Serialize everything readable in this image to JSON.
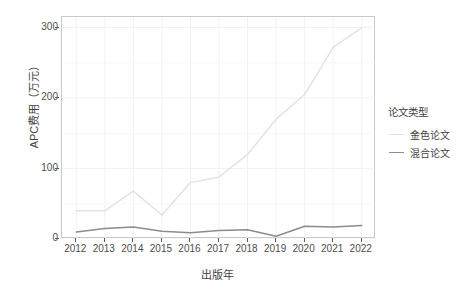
{
  "chart_data": {
    "type": "line",
    "title": "",
    "xlabel": "出版年",
    "ylabel": "APC费用（万元）",
    "categories": [
      "2012",
      "2013",
      "2014",
      "2015",
      "2016",
      "2017",
      "2018",
      "2019",
      "2020",
      "2021",
      "2022"
    ],
    "x": [
      2012,
      2013,
      2014,
      2015,
      2016,
      2017,
      2018,
      2019,
      2020,
      2021,
      2022
    ],
    "series": [
      {
        "name": "金色论文",
        "color": "#e3e3e3",
        "values": [
          40,
          40,
          68,
          34,
          80,
          88,
          120,
          170,
          205,
          272,
          300
        ]
      },
      {
        "name": "混合论文",
        "color": "#8c8c8c",
        "values": [
          10,
          15,
          17,
          11,
          9,
          12,
          13,
          4,
          18,
          17,
          19
        ]
      }
    ],
    "ylim": [
      0,
      315
    ],
    "xlim": [
      2011.5,
      2022.5
    ],
    "yticks": [
      0,
      100,
      200,
      300
    ],
    "ytick_labels": [
      "0",
      "100",
      "200",
      "300"
    ],
    "grid": true,
    "grid_color": "#f2f2f2",
    "legend_position": "right",
    "panel_background": "#ffffff",
    "panel_border_color": "#c9c9c9"
  },
  "legend": {
    "title": "论文类型",
    "items": [
      {
        "label": "金色论文",
        "color": "#e3e3e3"
      },
      {
        "label": "混合论文",
        "color": "#8c8c8c"
      }
    ]
  },
  "axes": {
    "y_title": "APC费用（万元）",
    "x_title": "出版年",
    "y_tick_labels": [
      "300",
      "200",
      "100",
      "0"
    ],
    "x_tick_labels": [
      "2012",
      "2013",
      "2014",
      "2015",
      "2016",
      "2017",
      "2018",
      "2019",
      "2020",
      "2021",
      "2022"
    ]
  }
}
